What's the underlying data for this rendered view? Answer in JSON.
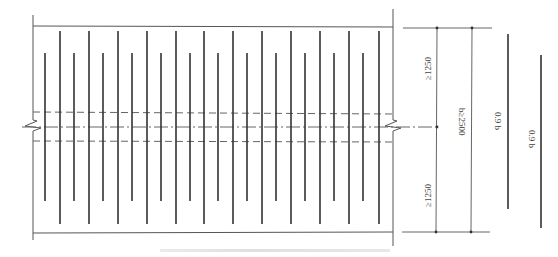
{
  "figure": {
    "type": "rebar layout plan (technical drawing)",
    "panel": {
      "boundary": {
        "left_x": 33,
        "right_x": 393,
        "top_y": 26,
        "bottom_y": 233
      },
      "dashed_lines_y": [
        112,
        141
      ],
      "centerline_y": 127,
      "break_marks": [
        {
          "x": 33,
          "y": 127
        },
        {
          "x": 393,
          "y": 127
        }
      ],
      "short_bars": {
        "x": [
          45,
          74,
          103,
          132,
          161,
          190,
          218,
          247,
          276,
          305,
          334,
          363
        ],
        "y1": 53,
        "y2": 201
      },
      "long_bars": {
        "x": [
          60,
          89,
          118,
          147,
          176,
          204,
          233,
          262,
          291,
          320,
          349,
          379
        ],
        "y1": 31,
        "y2": 224
      }
    },
    "dimensions": {
      "upper_segment": "≥1250",
      "lower_segment": "≥1250",
      "total_width": "b≥2500"
    },
    "bar_lengths": [
      {
        "label": "0.9 b",
        "x": 508,
        "y1": 34,
        "y2": 209
      },
      {
        "label": "0.9 b",
        "x": 541,
        "y1": 55,
        "y2": 228
      }
    ],
    "colors": {
      "line": "#444444",
      "bar": "#333333",
      "dim": "#555555",
      "background": "#ffffff"
    }
  }
}
